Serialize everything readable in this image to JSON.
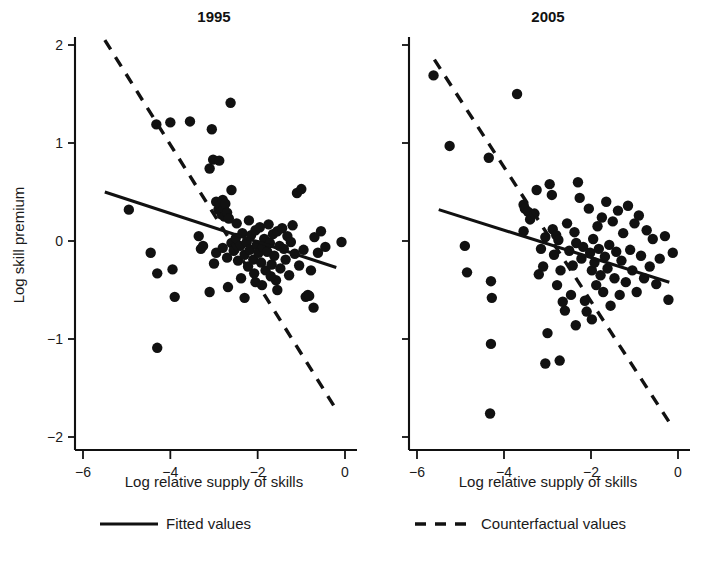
{
  "figure": {
    "background": "#ffffff",
    "ink_color": "#111111"
  },
  "panels": [
    {
      "id": "left",
      "title": "1995",
      "xlabel": "Log relative supply of skills",
      "ylabel": "Log skill premium"
    },
    {
      "id": "right",
      "title": "2005",
      "xlabel": "Log relative supply of skills",
      "ylabel": ""
    }
  ],
  "legend": {
    "position": "bottom",
    "entries": [
      {
        "label": "Fitted values",
        "style": "solid"
      },
      {
        "label": "Counterfactual values",
        "style": "dashed"
      }
    ]
  },
  "axes": {
    "x_ticks": [
      "-6",
      "-4",
      "-2",
      "0"
    ],
    "x_tick_values": [
      -6,
      -4,
      -2,
      0
    ],
    "y_ticks": [
      "2",
      "1",
      "0",
      "-1",
      "-2"
    ],
    "y_tick_values": [
      2,
      1,
      0,
      -1,
      -2
    ],
    "xlim": [
      -6.4,
      0.3
    ],
    "ylim": [
      -2.25,
      2.3
    ]
  },
  "chart_data": {
    "type": "scatter",
    "xlabel": "Log relative supply of skills",
    "ylabel": "Log skill premium",
    "xlim": [
      -6.4,
      0.3
    ],
    "ylim": [
      -2.25,
      2.3
    ],
    "grid": false,
    "legend_position": "bottom",
    "panels": [
      {
        "name": "1995",
        "points": [
          [
            -4.95,
            0.32
          ],
          [
            -4.3,
            -1.09
          ],
          [
            -4.32,
            1.19
          ],
          [
            -4.0,
            1.21
          ],
          [
            -4.45,
            -0.12
          ],
          [
            -4.3,
            -0.33
          ],
          [
            -3.95,
            -0.29
          ],
          [
            -3.9,
            -0.57
          ],
          [
            -3.55,
            1.22
          ],
          [
            -3.3,
            -0.08
          ],
          [
            -3.35,
            0.05
          ],
          [
            -3.1,
            0.74
          ],
          [
            -3.05,
            1.14
          ],
          [
            -3.02,
            0.83
          ],
          [
            -2.88,
            0.82
          ],
          [
            -2.62,
            1.41
          ],
          [
            -2.95,
            0.4
          ],
          [
            -2.9,
            0.32
          ],
          [
            -2.86,
            0.36
          ],
          [
            -2.84,
            0.3
          ],
          [
            -2.82,
            0.27
          ],
          [
            -2.8,
            0.42
          ],
          [
            -2.78,
            0.33
          ],
          [
            -2.76,
            0.25
          ],
          [
            -2.74,
            0.38
          ],
          [
            -2.7,
            0.29
          ],
          [
            -2.66,
            0.23
          ],
          [
            -2.6,
            0.52
          ],
          [
            -3.25,
            -0.05
          ],
          [
            -3.1,
            -0.52
          ],
          [
            -3.0,
            -0.23
          ],
          [
            -2.95,
            -0.12
          ],
          [
            -2.8,
            -0.07
          ],
          [
            -2.7,
            -0.17
          ],
          [
            -2.6,
            -0.02
          ],
          [
            -2.55,
            -0.1
          ],
          [
            -2.5,
            0.03
          ],
          [
            -2.45,
            -0.2
          ],
          [
            -2.4,
            -0.05
          ],
          [
            -2.38,
            -0.38
          ],
          [
            -2.35,
            0.08
          ],
          [
            -2.3,
            -0.14
          ],
          [
            -2.25,
            -0.01
          ],
          [
            -2.22,
            -0.26
          ],
          [
            -2.18,
            -0.09
          ],
          [
            -2.15,
            0.06
          ],
          [
            -2.1,
            -0.19
          ],
          [
            -2.08,
            -0.33
          ],
          [
            -2.05,
            0.11
          ],
          [
            -2.02,
            -0.04
          ],
          [
            -1.98,
            -0.12
          ],
          [
            -1.95,
            0.14
          ],
          [
            -1.92,
            -0.22
          ],
          [
            -1.88,
            -0.06
          ],
          [
            -1.85,
            0.02
          ],
          [
            -1.82,
            -0.3
          ],
          [
            -1.78,
            -0.11
          ],
          [
            -1.75,
            0.17
          ],
          [
            -1.72,
            -0.02
          ],
          [
            -1.68,
            -0.24
          ],
          [
            -1.65,
            0.07
          ],
          [
            -1.62,
            -0.15
          ],
          [
            -1.58,
            -0.4
          ],
          [
            -1.55,
            0.1
          ],
          [
            -1.5,
            -0.05
          ],
          [
            -1.48,
            -0.28
          ],
          [
            -1.44,
            0.13
          ],
          [
            -1.4,
            -0.08
          ],
          [
            -1.36,
            -0.19
          ],
          [
            -1.32,
            0.05
          ],
          [
            -1.28,
            -0.35
          ],
          [
            -1.24,
            -0.01
          ],
          [
            -1.2,
            0.16
          ],
          [
            -1.15,
            -0.13
          ],
          [
            -1.1,
            0.49
          ],
          [
            -1.05,
            -0.25
          ],
          [
            -1.0,
            0.53
          ],
          [
            -0.95,
            -0.09
          ],
          [
            -0.9,
            -0.57
          ],
          [
            -0.85,
            -0.55
          ],
          [
            -0.82,
            -0.56
          ],
          [
            -0.78,
            -0.3
          ],
          [
            -0.72,
            -0.68
          ],
          [
            -0.7,
            0.04
          ],
          [
            -0.62,
            -0.12
          ],
          [
            -0.55,
            0.1
          ],
          [
            -0.45,
            -0.06
          ],
          [
            -0.08,
            -0.01
          ],
          [
            -2.68,
            -0.47
          ],
          [
            -2.3,
            -0.58
          ],
          [
            -2.05,
            -0.42
          ],
          [
            -1.9,
            -0.45
          ],
          [
            -1.7,
            -0.36
          ],
          [
            -1.55,
            -0.5
          ],
          [
            -2.48,
            0.18
          ],
          [
            -2.2,
            0.21
          ]
        ],
        "fitted_line": {
          "x": [
            -5.5,
            -0.2
          ],
          "y": [
            0.5,
            -0.27
          ],
          "style": "solid"
        },
        "counterfactual_line": {
          "x": [
            -5.5,
            -0.2
          ],
          "y": [
            2.05,
            -1.72
          ],
          "style": "dashed"
        }
      },
      {
        "name": "2005",
        "points": [
          [
            -5.62,
            1.69
          ],
          [
            -5.25,
            0.97
          ],
          [
            -4.9,
            -0.05
          ],
          [
            -4.85,
            -0.32
          ],
          [
            -4.35,
            0.85
          ],
          [
            -4.3,
            -0.41
          ],
          [
            -4.28,
            -0.58
          ],
          [
            -4.3,
            -1.05
          ],
          [
            -4.32,
            -1.76
          ],
          [
            -3.7,
            1.5
          ],
          [
            -3.55,
            0.37
          ],
          [
            -3.52,
            0.33
          ],
          [
            -3.45,
            0.3
          ],
          [
            -3.4,
            0.22
          ],
          [
            -3.55,
            0.1
          ],
          [
            -3.3,
            0.28
          ],
          [
            -3.25,
            0.52
          ],
          [
            -3.2,
            -0.34
          ],
          [
            -3.15,
            -0.08
          ],
          [
            -3.1,
            -0.26
          ],
          [
            -3.05,
            0.04
          ],
          [
            -3.0,
            -0.94
          ],
          [
            -2.95,
            0.58
          ],
          [
            -2.9,
            0.47
          ],
          [
            -2.88,
            0.12
          ],
          [
            -2.85,
            -0.14
          ],
          [
            -2.8,
            0.06
          ],
          [
            -2.78,
            -0.45
          ],
          [
            -2.75,
            0.01
          ],
          [
            -2.7,
            -0.3
          ],
          [
            -2.65,
            -0.62
          ],
          [
            -2.6,
            -0.71
          ],
          [
            -2.55,
            0.18
          ],
          [
            -2.5,
            -0.1
          ],
          [
            -2.46,
            -0.55
          ],
          [
            -2.42,
            -0.25
          ],
          [
            -2.38,
            0.09
          ],
          [
            -2.34,
            -0.02
          ],
          [
            -2.3,
            0.6
          ],
          [
            -2.26,
            0.44
          ],
          [
            -2.22,
            -0.18
          ],
          [
            -2.18,
            -0.06
          ],
          [
            -2.14,
            -0.61
          ],
          [
            -2.1,
            -0.72
          ],
          [
            -2.05,
            0.33
          ],
          [
            -2.02,
            -0.12
          ],
          [
            -1.98,
            -0.3
          ],
          [
            -1.95,
            0.02
          ],
          [
            -1.92,
            -0.22
          ],
          [
            -1.88,
            -0.45
          ],
          [
            -1.85,
            0.15
          ],
          [
            -1.82,
            -0.08
          ],
          [
            -1.78,
            -0.35
          ],
          [
            -1.75,
            0.24
          ],
          [
            -1.72,
            -0.52
          ],
          [
            -1.68,
            -0.16
          ],
          [
            -1.65,
            0.4
          ],
          [
            -1.62,
            -0.28
          ],
          [
            -1.58,
            -0.04
          ],
          [
            -1.55,
            -0.66
          ],
          [
            -1.5,
            0.2
          ],
          [
            -1.46,
            -0.38
          ],
          [
            -1.42,
            -0.11
          ],
          [
            -1.38,
            0.31
          ],
          [
            -1.34,
            -0.55
          ],
          [
            -1.3,
            -0.2
          ],
          [
            -1.26,
            0.08
          ],
          [
            -1.2,
            -0.42
          ],
          [
            -1.15,
            0.36
          ],
          [
            -1.1,
            -0.09
          ],
          [
            -1.05,
            -0.3
          ],
          [
            -1.0,
            0.18
          ],
          [
            -0.95,
            -0.52
          ],
          [
            -0.9,
            0.26
          ],
          [
            -0.85,
            -0.15
          ],
          [
            -0.78,
            -0.38
          ],
          [
            -0.72,
            0.11
          ],
          [
            -0.65,
            -0.26
          ],
          [
            -0.58,
            0.02
          ],
          [
            -0.5,
            -0.44
          ],
          [
            -0.42,
            -0.18
          ],
          [
            -0.3,
            0.05
          ],
          [
            -0.22,
            -0.6
          ],
          [
            -0.12,
            -0.12
          ],
          [
            -2.72,
            -1.22
          ],
          [
            -3.05,
            -1.25
          ],
          [
            -2.35,
            -0.86
          ],
          [
            -1.98,
            -0.8
          ]
        ],
        "fitted_line": {
          "x": [
            -5.5,
            -0.2
          ],
          "y": [
            0.32,
            -0.42
          ],
          "style": "solid"
        },
        "counterfactual_line": {
          "x": [
            -5.6,
            -0.2
          ],
          "y": [
            1.85,
            -1.85
          ],
          "style": "dashed"
        }
      }
    ]
  }
}
